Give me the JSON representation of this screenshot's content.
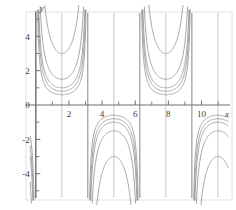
{
  "figure": {
    "background": "#ffffff",
    "frame_color": "#e2e2e2",
    "axis_color": "#6e6e6e",
    "curve_color": "#9a9a9a",
    "asymptote_major_color": "#858585",
    "asymptote_minor_color": "#b9b9b9",
    "tick_label_color": "#3a3a3a"
  },
  "axes": {
    "x_name": "x",
    "y_name": "y",
    "x_ticks_major": [
      {
        "value": 2,
        "label": "2"
      },
      {
        "value": 4,
        "label": "4"
      },
      {
        "value": 6,
        "label": "6"
      },
      {
        "value": 8,
        "label": "8"
      },
      {
        "value": 10,
        "label": "10"
      }
    ],
    "x_ticks_minor": [
      1,
      3,
      5,
      7,
      9,
      11
    ],
    "y_ticks_major": [
      {
        "value": 4,
        "label": "4"
      },
      {
        "value": 2,
        "label": "2"
      },
      {
        "value": 0,
        "label": "0"
      },
      {
        "value": -2,
        "label": "-2"
      },
      {
        "value": -4,
        "label": "-4"
      }
    ],
    "y_ticks_minor": [
      5,
      3,
      1,
      -1,
      -3,
      -5
    ]
  },
  "chart_data": {
    "type": "line",
    "title": "",
    "xlabel": "x",
    "ylabel": "y",
    "xlim": [
      -0.35,
      11.6
    ],
    "ylim": [
      -5.3,
      5.3
    ],
    "grid": false,
    "legend": "none",
    "function_family": "y = k * csc(x)",
    "period": 3.141592653589793,
    "asymptotes_major": [
      0,
      3.14,
      6.28,
      9.42
    ],
    "asymptotes_minor": [
      1.57,
      4.71,
      7.85,
      10.99
    ],
    "series": [
      {
        "name": "k = 0.6",
        "k": 0.6,
        "extrema_above": 0.6,
        "extrema_below": -0.6
      },
      {
        "name": "k = 0.8",
        "k": 0.8,
        "extrema_above": 0.8,
        "extrema_below": -0.8
      },
      {
        "name": "k = 1.0",
        "k": 1.0,
        "extrema_above": 1.0,
        "extrema_below": -1.0
      },
      {
        "name": "k = 1.5",
        "k": 1.5,
        "extrema_above": 1.5,
        "extrema_below": -1.5
      },
      {
        "name": "k = 3.0",
        "k": 3.0,
        "extrema_above": 3.0,
        "extrema_below": -3.0
      }
    ],
    "minima_x_above_axis": [
      1.57,
      4.71,
      7.85,
      10.99
    ],
    "maxima_x_below_axis": [
      3.14,
      6.28,
      9.42
    ]
  }
}
